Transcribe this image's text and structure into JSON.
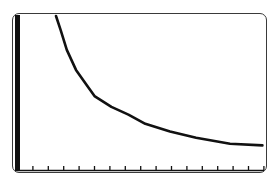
{
  "colors": {
    "background": "#ffffff",
    "frame": "#3a3a3a",
    "curve": "#111111",
    "axis": "#111111"
  },
  "chart_data": {
    "type": "line",
    "title": "",
    "xlabel": "",
    "ylabel": "",
    "grid": false,
    "legend": null,
    "x_ticks": [
      1,
      2,
      3,
      4,
      5,
      6,
      7,
      8,
      9,
      10,
      11,
      12,
      13,
      14,
      15,
      16
    ],
    "x_tick_labels": [],
    "y_ticks": [],
    "xlim": [
      0,
      16.2
    ],
    "ylim": [
      0,
      10.1
    ],
    "series": [
      {
        "name": "curve",
        "x": [
          2.5,
          2.8,
          3.2,
          3.8,
          4.5,
          5.0,
          6.1,
          7.2,
          8.3,
          9.9,
          11.6,
          13.8,
          15.9
        ],
        "y": [
          10.0,
          9.1,
          7.8,
          6.5,
          5.5,
          4.8,
          4.1,
          3.6,
          3.0,
          2.5,
          2.1,
          1.7,
          1.6
        ]
      }
    ]
  }
}
